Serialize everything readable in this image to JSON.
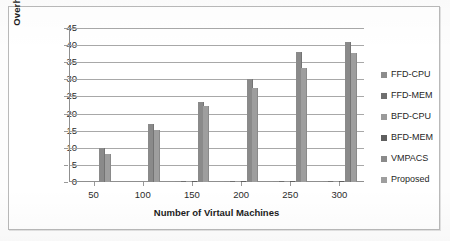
{
  "chart_data": {
    "type": "bar",
    "title": "",
    "xlabel": "Number of Virtaul Machines",
    "ylabel": "Overhead Time (Seconds)",
    "categories": [
      "50",
      "100",
      "150",
      "200",
      "250",
      "300"
    ],
    "ylim": [
      0,
      45
    ],
    "yticks": [
      0,
      5,
      10,
      15,
      20,
      25,
      30,
      35,
      40,
      45
    ],
    "grid": true,
    "legend_position": "right",
    "series": [
      {
        "name": "FFD-CPU",
        "color": "#8c8c8c",
        "values": [
          0,
          0,
          0.1,
          0.1,
          0.2,
          0.2
        ]
      },
      {
        "name": "FFD-MEM",
        "color": "#6f6f6f",
        "values": [
          0,
          0,
          0.1,
          0.1,
          0.2,
          0.2
        ]
      },
      {
        "name": "BFD-CPU",
        "color": "#9a9a9a",
        "values": [
          0,
          0,
          0.1,
          0.1,
          0.2,
          0.2
        ]
      },
      {
        "name": "BFD-MEM",
        "color": "#5f5f5f",
        "values": [
          0,
          0,
          0.1,
          0.1,
          0.2,
          0.2
        ]
      },
      {
        "name": "VMPACS",
        "color": "#8a8a8a",
        "values": [
          9.8,
          17.0,
          23.5,
          30.2,
          38.0,
          41.0
        ]
      },
      {
        "name": "Proposed",
        "color": "#9e9e9e",
        "values": [
          8.2,
          15.3,
          22.1,
          27.5,
          33.4,
          37.6
        ]
      }
    ]
  }
}
